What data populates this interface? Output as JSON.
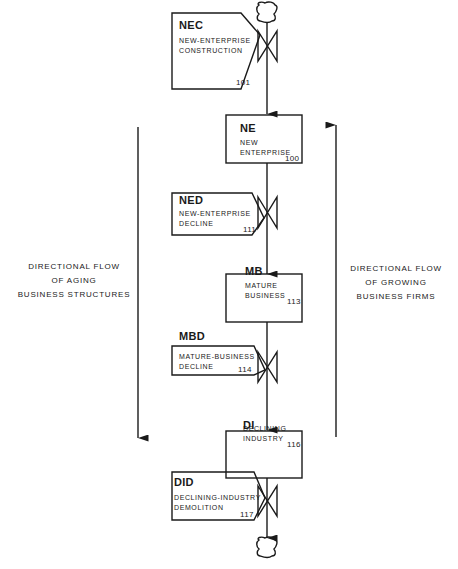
{
  "diagram": {
    "type": "flow",
    "source_sink_symbol": "cloud",
    "levels": [
      {
        "code": "NEC",
        "name_line1": "NEW-ENTERPRISE",
        "name_line2": "CONSTRUCTION",
        "number": "101",
        "kind": "rate"
      },
      {
        "code": "NE",
        "name_line1": "NEW",
        "name_line2": "ENTERPRISE",
        "number": "100",
        "kind": "level"
      },
      {
        "code": "NED",
        "name_line1": "NEW-ENTERPRISE",
        "name_line2": "DECLINE",
        "number": "111",
        "kind": "rate"
      },
      {
        "code": "MB",
        "name_line1": "MATURE",
        "name_line2": "BUSINESS",
        "number": "113",
        "kind": "level"
      },
      {
        "code": "MBD",
        "name_line1": "MATURE-BUSINESS",
        "name_line2": "DECLINE",
        "number": "114",
        "kind": "rate"
      },
      {
        "code": "DI",
        "name_line1": "DECLINING",
        "name_line2": "INDUSTRY",
        "number": "116",
        "kind": "level"
      },
      {
        "code": "DID",
        "name_line1": "DECLINING-INDUSTRY",
        "name_line2": "DEMOLITION",
        "number": "117",
        "kind": "rate"
      }
    ],
    "left_annotation": {
      "line1": "DIRECTIONAL  FLOW",
      "line2": "OF  AGING",
      "line3": "BUSINESS  STRUCTURES",
      "arrow_direction": "down"
    },
    "right_annotation": {
      "line1": "DIRECTIONAL  FLOW",
      "line2": "OF  GROWING",
      "line3": "BUSINESS  FIRMS",
      "arrow_direction": "up"
    },
    "colors": {
      "ink": "#1a1a1a",
      "background": "#ffffff"
    }
  }
}
